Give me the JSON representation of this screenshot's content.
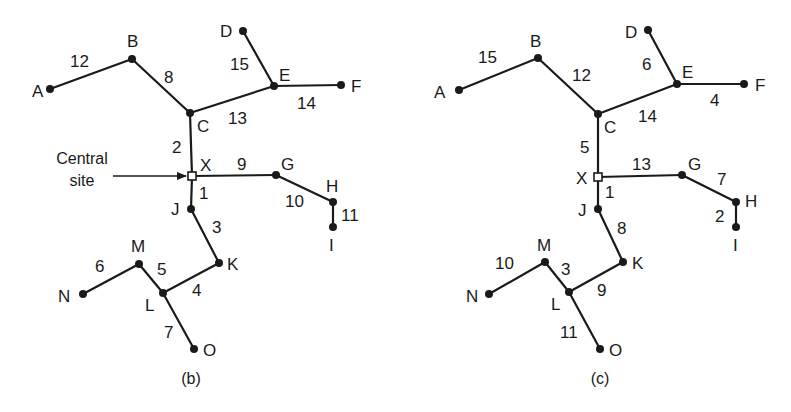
{
  "diagrams": [
    {
      "id": "b",
      "caption": "(b)",
      "caption_pos": [
        191,
        384
      ],
      "annotation": {
        "lines": [
          "Central",
          "site"
        ],
        "text_pos": [
          82,
          164
        ],
        "line_gap": 22,
        "arrow_from": [
          113,
          176
        ],
        "arrow_to": [
          186,
          176
        ]
      },
      "nodes": [
        {
          "id": "A",
          "x": 50,
          "y": 89,
          "lx": 32,
          "ly": 97,
          "type": "dot"
        },
        {
          "id": "B",
          "x": 132,
          "y": 59,
          "lx": 127,
          "ly": 47,
          "type": "dot"
        },
        {
          "id": "C",
          "x": 190,
          "y": 113,
          "lx": 197,
          "ly": 132,
          "type": "dot"
        },
        {
          "id": "D",
          "x": 243,
          "y": 31,
          "lx": 220,
          "ly": 37,
          "type": "dot"
        },
        {
          "id": "E",
          "x": 274,
          "y": 86,
          "lx": 279,
          "ly": 81,
          "type": "dot"
        },
        {
          "id": "F",
          "x": 341,
          "y": 85,
          "lx": 351,
          "ly": 92,
          "type": "dot"
        },
        {
          "id": "X",
          "x": 192,
          "y": 176,
          "lx": 200,
          "ly": 171,
          "type": "site"
        },
        {
          "id": "G",
          "x": 276,
          "y": 175,
          "lx": 281,
          "ly": 170,
          "type": "dot"
        },
        {
          "id": "H",
          "x": 333,
          "y": 202,
          "lx": 326,
          "ly": 192,
          "type": "dot"
        },
        {
          "id": "I",
          "x": 333,
          "y": 227,
          "lx": 329,
          "ly": 251,
          "type": "dot"
        },
        {
          "id": "J",
          "x": 191,
          "y": 209,
          "lx": 171,
          "ly": 215,
          "type": "dot"
        },
        {
          "id": "K",
          "x": 219,
          "y": 263,
          "lx": 227,
          "ly": 270,
          "type": "dot"
        },
        {
          "id": "L",
          "x": 163,
          "y": 293,
          "lx": 145,
          "ly": 311,
          "type": "dot"
        },
        {
          "id": "M",
          "x": 139,
          "y": 264,
          "lx": 131,
          "ly": 252,
          "type": "dot"
        },
        {
          "id": "N",
          "x": 83,
          "y": 294,
          "lx": 58,
          "ly": 302,
          "type": "dot"
        },
        {
          "id": "O",
          "x": 194,
          "y": 349,
          "lx": 203,
          "ly": 356,
          "type": "dot"
        }
      ],
      "edges": [
        {
          "from": "A",
          "to": "B",
          "weight": "12",
          "wx": 70,
          "wy": 67
        },
        {
          "from": "B",
          "to": "C",
          "weight": "8",
          "wx": 164,
          "wy": 83
        },
        {
          "from": "C",
          "to": "E",
          "weight": "13",
          "wx": 228,
          "wy": 124
        },
        {
          "from": "D",
          "to": "E",
          "weight": "15",
          "wx": 230,
          "wy": 70
        },
        {
          "from": "E",
          "to": "F",
          "weight": "14",
          "wx": 297,
          "wy": 109
        },
        {
          "from": "C",
          "to": "X",
          "weight": "2",
          "wx": 172,
          "wy": 153
        },
        {
          "from": "X",
          "to": "G",
          "weight": "9",
          "wx": 237,
          "wy": 170
        },
        {
          "from": "G",
          "to": "H",
          "weight": "10",
          "wx": 285,
          "wy": 207
        },
        {
          "from": "H",
          "to": "I",
          "weight": "11",
          "wx": 341,
          "wy": 221
        },
        {
          "from": "X",
          "to": "J",
          "weight": "1",
          "wx": 199,
          "wy": 199
        },
        {
          "from": "J",
          "to": "K",
          "weight": "3",
          "wx": 212,
          "wy": 233
        },
        {
          "from": "K",
          "to": "L",
          "weight": "4",
          "wx": 192,
          "wy": 296
        },
        {
          "from": "M",
          "to": "L",
          "weight": "5",
          "wx": 157,
          "wy": 275
        },
        {
          "from": "N",
          "to": "M",
          "weight": "6",
          "wx": 95,
          "wy": 272
        },
        {
          "from": "L",
          "to": "O",
          "weight": "7",
          "wx": 164,
          "wy": 338
        }
      ]
    },
    {
      "id": "c",
      "caption": "(c)",
      "caption_pos": [
        600,
        384
      ],
      "annotation": null,
      "nodes": [
        {
          "id": "A",
          "x": 459,
          "y": 90,
          "lx": 434,
          "ly": 98,
          "type": "dot"
        },
        {
          "id": "B",
          "x": 538,
          "y": 58,
          "lx": 530,
          "ly": 47,
          "type": "dot"
        },
        {
          "id": "C",
          "x": 598,
          "y": 114,
          "lx": 604,
          "ly": 133,
          "type": "dot"
        },
        {
          "id": "D",
          "x": 648,
          "y": 30,
          "lx": 625,
          "ly": 38,
          "type": "dot"
        },
        {
          "id": "E",
          "x": 677,
          "y": 84,
          "lx": 682,
          "ly": 78,
          "type": "dot"
        },
        {
          "id": "F",
          "x": 744,
          "y": 84,
          "lx": 755,
          "ly": 91,
          "type": "dot"
        },
        {
          "id": "X",
          "x": 598,
          "y": 177,
          "lx": 576,
          "ly": 184,
          "type": "site"
        },
        {
          "id": "G",
          "x": 682,
          "y": 175,
          "lx": 688,
          "ly": 170,
          "type": "dot"
        },
        {
          "id": "H",
          "x": 736,
          "y": 202,
          "lx": 745,
          "ly": 207,
          "type": "dot"
        },
        {
          "id": "I",
          "x": 736,
          "y": 227,
          "lx": 733,
          "ly": 251,
          "type": "dot"
        },
        {
          "id": "J",
          "x": 598,
          "y": 209,
          "lx": 578,
          "ly": 216,
          "type": "dot"
        },
        {
          "id": "K",
          "x": 623,
          "y": 262,
          "lx": 632,
          "ly": 269,
          "type": "dot"
        },
        {
          "id": "L",
          "x": 569,
          "y": 292,
          "lx": 551,
          "ly": 310,
          "type": "dot"
        },
        {
          "id": "M",
          "x": 545,
          "y": 262,
          "lx": 537,
          "ly": 251,
          "type": "dot"
        },
        {
          "id": "N",
          "x": 489,
          "y": 294,
          "lx": 466,
          "ly": 302,
          "type": "dot"
        },
        {
          "id": "O",
          "x": 600,
          "y": 349,
          "lx": 609,
          "ly": 356,
          "type": "dot"
        }
      ],
      "edges": [
        {
          "from": "A",
          "to": "B",
          "weight": "15",
          "wx": 478,
          "wy": 63
        },
        {
          "from": "B",
          "to": "C",
          "weight": "12",
          "wx": 572,
          "wy": 81
        },
        {
          "from": "C",
          "to": "E",
          "weight": "14",
          "wx": 638,
          "wy": 122
        },
        {
          "from": "D",
          "to": "E",
          "weight": "6",
          "wx": 642,
          "wy": 70
        },
        {
          "from": "E",
          "to": "F",
          "weight": "4",
          "wx": 710,
          "wy": 106
        },
        {
          "from": "C",
          "to": "X",
          "weight": "5",
          "wx": 580,
          "wy": 153
        },
        {
          "from": "X",
          "to": "G",
          "weight": "13",
          "wx": 632,
          "wy": 170
        },
        {
          "from": "G",
          "to": "H",
          "weight": "7",
          "wx": 717,
          "wy": 185
        },
        {
          "from": "H",
          "to": "I",
          "weight": "2",
          "wx": 715,
          "wy": 222
        },
        {
          "from": "X",
          "to": "J",
          "weight": "1",
          "wx": 605,
          "wy": 198
        },
        {
          "from": "J",
          "to": "K",
          "weight": "8",
          "wx": 617,
          "wy": 234
        },
        {
          "from": "K",
          "to": "L",
          "weight": "9",
          "wx": 597,
          "wy": 296
        },
        {
          "from": "M",
          "to": "L",
          "weight": "3",
          "wx": 561,
          "wy": 275
        },
        {
          "from": "N",
          "to": "M",
          "weight": "10",
          "wx": 495,
          "wy": 269
        },
        {
          "from": "L",
          "to": "O",
          "weight": "11",
          "wx": 560,
          "wy": 338
        }
      ]
    }
  ]
}
